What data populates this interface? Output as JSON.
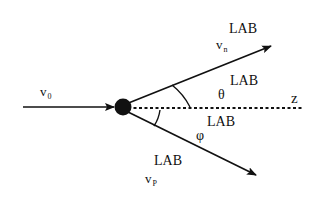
{
  "diagram": {
    "title": "",
    "incoming_particle": {
      "symbol": "v",
      "subscript": "0"
    },
    "outgoing_particle_n": {
      "symbol": "v",
      "subscript": "n",
      "superscript": "LAB"
    },
    "outgoing_particle_p": {
      "symbol": "v",
      "subscript": "P",
      "superscript": "LAB"
    },
    "angle_theta": {
      "symbol": "θ",
      "superscript": "LAB"
    },
    "angle_phi": {
      "symbol": "φ",
      "superscript": "LAB"
    },
    "axis": {
      "label": "z"
    },
    "colors": {
      "stroke": "#111111",
      "background": "#ffffff"
    }
  }
}
